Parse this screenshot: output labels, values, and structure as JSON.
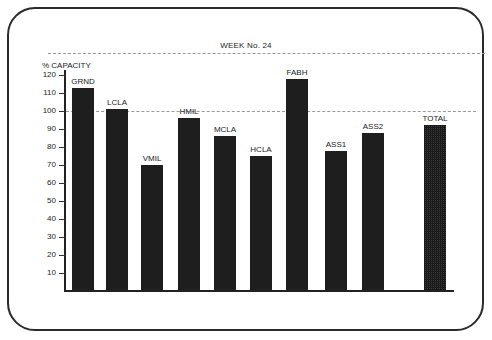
{
  "chart_data": {
    "type": "bar",
    "title": "WEEK No. 24",
    "xlabel": "",
    "ylabel": "% CAPACITY",
    "ylim": [
      0,
      120
    ],
    "yticks": [
      10,
      20,
      30,
      40,
      50,
      60,
      70,
      80,
      90,
      100,
      110,
      120
    ],
    "reference_lines": [
      100
    ],
    "categories": [
      "GRND",
      "LCLA",
      "VMIL",
      "HMIL",
      "MCLA",
      "HCLA",
      "FABH",
      "ASS1",
      "ASS2",
      "TOTAL"
    ],
    "values": [
      113,
      101,
      70,
      96,
      86,
      75,
      118,
      78,
      88,
      92
    ],
    "highlight": {
      "TOTAL": "patterned"
    },
    "grid": false,
    "legend": "none"
  },
  "colors": {
    "bar": "#1e1e1e",
    "total_bar": "#3a3a3a",
    "frame": "#2a2a2a",
    "dashed_line": "#999999"
  }
}
